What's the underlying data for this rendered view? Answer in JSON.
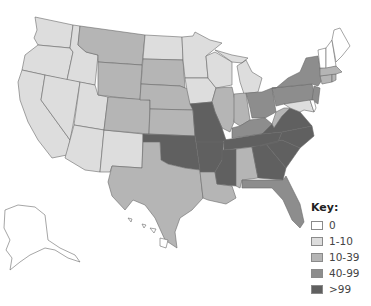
{
  "key": {
    "title": "Key:",
    "items": [
      {
        "label": "0",
        "color": "#ffffff"
      },
      {
        "label": "1-10",
        "color": "#dddddd"
      },
      {
        "label": "10-39",
        "color": "#b5b5b5"
      },
      {
        "label": "40-99",
        "color": "#8d8d8d"
      },
      {
        "label": ">99",
        "color": "#606060"
      }
    ]
  },
  "map": {
    "title": "United States map shaded by category",
    "states": {
      "WA": "1-10",
      "OR": "1-10",
      "CA": "1-10",
      "ID": "1-10",
      "NV": "1-10",
      "UT": "1-10",
      "AZ": "1-10",
      "NM": "1-10",
      "ND": "1-10",
      "MN": "1-10",
      "IA": "1-10",
      "WI": "1-10",
      "MI": "1-10",
      "MD": "1-10",
      "MT": "10-39",
      "WY": "10-39",
      "SD": "10-39",
      "NE": "10-39",
      "CO": "10-39",
      "KS": "10-39",
      "TX": "10-39",
      "LA": "10-39",
      "IL": "10-39",
      "IN": "10-39",
      "WV": "10-39",
      "AL": "10-39",
      "MA": "10-39",
      "CT": "10-39",
      "RI": "10-39",
      "NY": "40-99",
      "PA": "40-99",
      "OH": "40-99",
      "KY": "40-99",
      "FL": "40-99",
      "NJ": "40-99",
      "OK": ">99",
      "MO": ">99",
      "AR": ">99",
      "TN": ">99",
      "MS": ">99",
      "GA": ">99",
      "SC": ">99",
      "NC": ">99",
      "VA": ">99",
      "ME": "0",
      "NH": "0",
      "VT": "0",
      "AK": "0",
      "HI": "0",
      "DE": "0"
    }
  }
}
